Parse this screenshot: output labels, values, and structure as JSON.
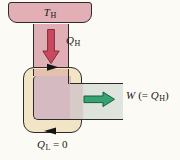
{
  "figure": {
    "labels": {
      "hot_reservoir": {
        "main": "T",
        "sub": "H"
      },
      "heat_in": {
        "main": "Q",
        "sub": "H"
      },
      "work_out": {
        "w": "W",
        "mid": "(= ",
        "q": "Q",
        "sub": "H",
        "close": ")"
      },
      "heat_out": {
        "main": "Q",
        "sub": "L",
        "rest": " = 0"
      }
    },
    "colors": {
      "reservoir_pink": "#e2afb6",
      "channel_pink": "#e0aeb5",
      "band_crossing_pink": "#e3c1ae",
      "engine_interior_mauve": "#d6bac2",
      "ring_cream": "#f1e5c6",
      "work_channel_gray": "#dde2da",
      "outline_dark": "#2d2b2a",
      "heat_arrow_red": "#c84a5f",
      "heat_arrow_red_stroke": "#842c3a",
      "work_arrow_green": "#36a271",
      "work_arrow_green_stroke": "#155f3d",
      "cycle_arrow_black": "#141414"
    }
  }
}
